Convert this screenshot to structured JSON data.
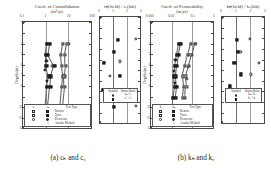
{
  "figure": {
    "captions": [
      {
        "id": "a",
        "text": "(a) cₕ and cᵥ",
        "center_x": 68
      },
      {
        "id": "b",
        "text": "(b) kₕ and kᵥ",
        "center_x": 196
      }
    ],
    "yaxis_title": "Depth (m)"
  },
  "panels": [
    {
      "key": "ch_cv",
      "title": "Coeff. of Consolidation",
      "units": "(m²/yr)",
      "xscale": "log",
      "xticks": [
        "0.1",
        "1",
        "10",
        "100"
      ],
      "xlim": [
        0.1,
        100
      ],
      "yticks": [
        "2",
        "4",
        "5",
        "6",
        "7",
        "8",
        "10",
        "11",
        "12"
      ],
      "ylim": [
        2,
        12
      ]
    },
    {
      "key": "ch_field_over_cv_lab",
      "title": "cₕ(field) / cᵥ(lab)",
      "units": "",
      "xscale": "linear",
      "xticks": [
        "0",
        "1",
        "2",
        "3"
      ],
      "xlim": [
        0,
        3
      ],
      "yticks": [],
      "ylim": [
        2,
        12
      ]
    },
    {
      "key": "kh_kv",
      "title": "Coeff. of Permeability",
      "units": "(m/yr)",
      "xscale": "log",
      "xticks": [
        "0.001",
        "0.01",
        "0.1",
        "1"
      ],
      "xlim": [
        0.001,
        1
      ],
      "yticks": [
        "2",
        "4",
        "5",
        "6",
        "7",
        "8",
        "10",
        "11",
        "12"
      ],
      "ylim": [
        2,
        12
      ]
    },
    {
      "key": "kh_field_over_kv_lab",
      "title": "kₕ(field) / kᵥ(lab)",
      "units": "",
      "xscale": "linear",
      "xticks": [
        "0",
        "1",
        "2",
        "3"
      ],
      "xlim": [
        0,
        3
      ],
      "yticks": [],
      "ylim": [
        2,
        12
      ]
    }
  ],
  "legends": {
    "consolidation": {
      "header_left": "cᵥ",
      "header_mid": "cₕ",
      "header_right": "Test Type",
      "rows": [
        {
          "left": "sq-open",
          "mid": "sq-fill",
          "label": "Restore"
        },
        {
          "left": "sq-open",
          "mid": "sq-fill",
          "label": "Tyres"
        },
        {
          "left": "ci-open",
          "mid": "ci-fill",
          "label": "Piezocone"
        },
        {
          "left": "",
          "mid": "tri-open",
          "label": "Asaoka Method"
        }
      ]
    },
    "permeability": {
      "header_left": "kᵥ",
      "header_mid": "kₕ",
      "header_right": "Test Type",
      "rows": [
        {
          "left": "sq-open",
          "mid": "sq-fill",
          "label": "Restore"
        },
        {
          "left": "sq-open",
          "mid": "sq-fill",
          "label": "Tyres"
        },
        {
          "left": "ci-open",
          "mid": "ci-fill",
          "label": "Piezocone"
        },
        {
          "left": "",
          "mid": "tri-open",
          "label": "Asaoka Method"
        }
      ]
    },
    "ratio_c": {
      "header_left": "Symbol",
      "header_right": "Strain Ratio",
      "rows": [
        {
          "sym": "ci-open",
          "label": "cₕ / cᵥ"
        },
        {
          "sym": "sq-fill",
          "label": "cᵥ' / cᵥ"
        }
      ]
    },
    "ratio_k": {
      "header_left": "Symbol",
      "header_right": "Strain Ratio",
      "rows": [
        {
          "sym": "ci-open",
          "label": "kₕ / kᵥ"
        },
        {
          "sym": "sq-fill",
          "label": "kᵥ' / kᵥ"
        }
      ]
    }
  },
  "chart_data": [
    {
      "type": "scatter",
      "panel": "a-left",
      "title": "Coeff. of Consolidation",
      "xlabel": "Coeff. of Consolidation (m²/yr)",
      "ylabel": "Depth (m)",
      "xscale": "log",
      "xlim": [
        0.1,
        100
      ],
      "ylim": [
        2,
        12
      ],
      "yinverted": true,
      "grid": true,
      "legend_position": "inside-bottom-left",
      "series": [
        {
          "name": "cᵥ Restore",
          "marker": "sq-open",
          "connected": true,
          "points": [
            {
              "x": 5.0,
              "depth": 4.0
            },
            {
              "x": 4.2,
              "depth": 5.0
            },
            {
              "x": 4.6,
              "depth": 6.0
            },
            {
              "x": 5.2,
              "depth": 7.0
            },
            {
              "x": 4.8,
              "depth": 8.0
            },
            {
              "x": 4.0,
              "depth": 10.0
            }
          ]
        },
        {
          "name": "cᵥ Tyres",
          "marker": "sq-open",
          "connected": true,
          "points": [
            {
              "x": 8.0,
              "depth": 4.0
            },
            {
              "x": 6.5,
              "depth": 5.0
            },
            {
              "x": 6.8,
              "depth": 6.0
            },
            {
              "x": 6.0,
              "depth": 7.0
            },
            {
              "x": 6.2,
              "depth": 8.0
            },
            {
              "x": 5.0,
              "depth": 10.0
            }
          ]
        },
        {
          "name": "cₕ Restore",
          "marker": "sq-fill",
          "connected": true,
          "points": [
            {
              "x": 1.1,
              "depth": 4.0
            },
            {
              "x": 0.95,
              "depth": 5.0
            },
            {
              "x": 1.0,
              "depth": 6.0
            },
            {
              "x": 1.3,
              "depth": 7.0
            },
            {
              "x": 1.05,
              "depth": 8.0
            },
            {
              "x": 0.9,
              "depth": 10.0
            }
          ]
        },
        {
          "name": "cₕ Tyres",
          "marker": "sq-fill",
          "connected": true,
          "points": [
            {
              "x": 1.4,
              "depth": 4.0
            },
            {
              "x": 1.2,
              "depth": 5.0
            },
            {
              "x": 2.2,
              "depth": 6.0
            },
            {
              "x": 1.6,
              "depth": 7.0
            },
            {
              "x": 1.5,
              "depth": 8.0
            },
            {
              "x": 1.2,
              "depth": 10.0
            }
          ]
        },
        {
          "name": "Piezocone cₕ",
          "marker": "ci-fill",
          "connected": false,
          "points": [
            {
              "x": 1.0,
              "depth": 5.6
            },
            {
              "x": 0.85,
              "depth": 6.4
            },
            {
              "x": 1.1,
              "depth": 7.4
            }
          ]
        },
        {
          "name": "Piezocone cᵥ",
          "marker": "ci-open",
          "connected": false,
          "points": [
            {
              "x": 9.5,
              "depth": 4.0
            },
            {
              "x": 1.8,
              "depth": 6.0
            },
            {
              "x": 5.5,
              "depth": 7.0
            }
          ]
        },
        {
          "name": "Asaoka Method",
          "marker": "tri-open",
          "connected": false,
          "points": [
            {
              "x": 1.0,
              "depth": 6.6
            },
            {
              "x": 5.0,
              "depth": 10.3
            }
          ]
        }
      ]
    },
    {
      "type": "scatter",
      "panel": "a-right",
      "title": "cₕ(field) / cᵥ(lab)",
      "xlabel": "cₕ(field) / cᵥ(lab)",
      "ylabel": "Depth (m)",
      "xscale": "linear",
      "xlim": [
        0,
        3
      ],
      "ylim": [
        2,
        12
      ],
      "yinverted": true,
      "grid": true,
      "reference_line_x": 1,
      "series": [
        {
          "name": "cₕ / cᵥ",
          "marker": "ci-open",
          "connected": false,
          "points": [
            {
              "x": 2.55,
              "depth": 4.0
            },
            {
              "x": 1.45,
              "depth": 6.1
            },
            {
              "x": 0.7,
              "depth": 7.4
            },
            {
              "x": 2.55,
              "depth": 10.2
            }
          ]
        },
        {
          "name": "cᵥ' / cᵥ",
          "marker": "sq-fill",
          "connected": false,
          "points": [
            {
              "x": 1.25,
              "depth": 4.1
            },
            {
              "x": 1.0,
              "depth": 5.2
            },
            {
              "x": 0.25,
              "depth": 6.2
            },
            {
              "x": 1.45,
              "depth": 7.4
            },
            {
              "x": 0.2,
              "depth": 8.7
            },
            {
              "x": 1.0,
              "depth": 10.3
            }
          ]
        }
      ]
    },
    {
      "type": "scatter",
      "panel": "b-left",
      "title": "Coeff. of Permeability",
      "xlabel": "Coeff. of Permeability (m/yr)",
      "ylabel": "Depth (m)",
      "xscale": "log",
      "xlim": [
        0.001,
        1
      ],
      "ylim": [
        2,
        12
      ],
      "yinverted": true,
      "grid": true,
      "legend_position": "inside-bottom-left",
      "series": [
        {
          "name": "kᵥ Restore",
          "marker": "sq-open",
          "connected": true,
          "points": [
            {
              "x": 0.075,
              "depth": 4.0
            },
            {
              "x": 0.055,
              "depth": 5.0
            },
            {
              "x": 0.04,
              "depth": 6.0
            },
            {
              "x": 0.03,
              "depth": 7.0
            },
            {
              "x": 0.034,
              "depth": 8.0
            },
            {
              "x": 0.03,
              "depth": 9.0
            }
          ]
        },
        {
          "name": "kᵥ Tyres",
          "marker": "sq-open",
          "connected": true,
          "points": [
            {
              "x": 0.11,
              "depth": 4.0
            },
            {
              "x": 0.085,
              "depth": 5.0
            },
            {
              "x": 0.06,
              "depth": 6.0
            },
            {
              "x": 0.042,
              "depth": 7.0
            },
            {
              "x": 0.046,
              "depth": 8.0
            },
            {
              "x": 0.04,
              "depth": 9.0
            }
          ]
        },
        {
          "name": "kₕ Restore",
          "marker": "sq-fill",
          "connected": true,
          "points": [
            {
              "x": 0.02,
              "depth": 4.0
            },
            {
              "x": 0.016,
              "depth": 5.0
            },
            {
              "x": 0.013,
              "depth": 6.0
            },
            {
              "x": 0.012,
              "depth": 7.0
            },
            {
              "x": 0.013,
              "depth": 8.0
            },
            {
              "x": 0.011,
              "depth": 9.0
            },
            {
              "x": 0.011,
              "depth": 10.2
            }
          ]
        },
        {
          "name": "kₕ Tyres",
          "marker": "sq-fill",
          "connected": true,
          "points": [
            {
              "x": 0.026,
              "depth": 4.0
            },
            {
              "x": 0.02,
              "depth": 5.0
            },
            {
              "x": 0.017,
              "depth": 6.0
            },
            {
              "x": 0.015,
              "depth": 7.0
            },
            {
              "x": 0.016,
              "depth": 8.0
            },
            {
              "x": 0.014,
              "depth": 9.0
            }
          ]
        },
        {
          "name": "Piezocone kₕ",
          "marker": "ci-fill",
          "connected": false,
          "points": [
            {
              "x": 0.014,
              "depth": 5.5
            },
            {
              "x": 0.012,
              "depth": 6.5
            },
            {
              "x": 0.013,
              "depth": 7.6
            }
          ]
        },
        {
          "name": "Piezocone kᵥ",
          "marker": "ci-open",
          "connected": false,
          "points": [
            {
              "x": 0.13,
              "depth": 4.0
            },
            {
              "x": 0.07,
              "depth": 5.0
            },
            {
              "x": 0.055,
              "depth": 6.1
            },
            {
              "x": 0.05,
              "depth": 7.2
            }
          ]
        },
        {
          "name": "Asaoka Method",
          "marker": "tri-open",
          "connected": false,
          "points": [
            {
              "x": 0.045,
              "depth": 5.2
            },
            {
              "x": 0.04,
              "depth": 8.6
            }
          ]
        }
      ]
    },
    {
      "type": "scatter",
      "panel": "b-right",
      "title": "kₕ(field) / kᵥ(lab)",
      "xlabel": "kₕ(field) / kᵥ(lab)",
      "ylabel": "Depth (m)",
      "xscale": "linear",
      "xlim": [
        0,
        3
      ],
      "ylim": [
        2,
        12
      ],
      "yinverted": true,
      "grid": true,
      "reference_line_x": 1,
      "series": [
        {
          "name": "kₕ / kᵥ",
          "marker": "ci-open",
          "connected": false,
          "points": [
            {
              "x": 1.9,
              "depth": 4.0
            },
            {
              "x": 1.25,
              "depth": 5.2
            },
            {
              "x": 2.5,
              "depth": 6.2
            },
            {
              "x": 1.95,
              "depth": 7.3
            },
            {
              "x": 0.75,
              "depth": 9.6
            }
          ]
        },
        {
          "name": "kᵥ' / kᵥ",
          "marker": "sq-fill",
          "connected": false,
          "points": [
            {
              "x": 1.0,
              "depth": 4.1
            },
            {
              "x": 1.1,
              "depth": 5.2
            },
            {
              "x": 0.85,
              "depth": 6.2
            },
            {
              "x": 1.3,
              "depth": 7.3
            },
            {
              "x": 0.55,
              "depth": 8.4
            },
            {
              "x": 1.4,
              "depth": 9.6
            }
          ]
        }
      ]
    }
  ]
}
